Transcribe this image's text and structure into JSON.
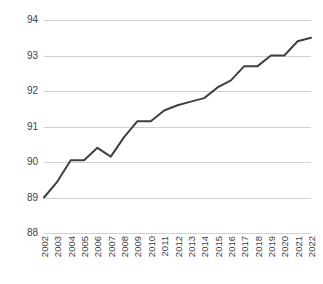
{
  "chart_data": {
    "type": "line",
    "title": "",
    "subtitle": "",
    "xlabel": "",
    "ylabel": "",
    "grid": true,
    "legend": false,
    "legend_position": "none",
    "xlim": [
      2002,
      2022
    ],
    "ylim": [
      88,
      94
    ],
    "ytick_labels": [
      "94",
      "93",
      "92",
      "91",
      "90",
      "89",
      "88"
    ],
    "yticks": [
      94,
      93,
      92,
      91,
      90,
      89,
      88
    ],
    "categories": [
      "2002",
      "2003",
      "2004",
      "2005",
      "2006",
      "2007",
      "2008",
      "2009",
      "2010",
      "2011",
      "2012",
      "2013",
      "2014",
      "2015",
      "2016",
      "2017",
      "2018",
      "2019",
      "2020",
      "2021",
      "2022"
    ],
    "values": [
      89.0,
      89.45,
      90.05,
      90.05,
      90.4,
      90.15,
      90.7,
      91.15,
      91.15,
      91.45,
      91.6,
      91.7,
      91.8,
      92.1,
      92.3,
      92.7,
      92.7,
      93.0,
      93.0,
      93.4,
      93.5
    ],
    "series": [
      {
        "name": "series-1",
        "color": "#404040",
        "line_width": 2,
        "values": [
          89.0,
          89.45,
          90.05,
          90.05,
          90.4,
          90.15,
          90.7,
          91.15,
          91.15,
          91.45,
          91.6,
          91.7,
          91.8,
          92.1,
          92.3,
          92.7,
          92.7,
          93.0,
          93.0,
          93.4,
          93.5
        ]
      }
    ],
    "annotations": []
  },
  "style": {
    "background": "#ffffff",
    "gridline_color": "#d0d0d0",
    "tick_label_color": "#3f3f3f",
    "line_color": "#404040"
  }
}
